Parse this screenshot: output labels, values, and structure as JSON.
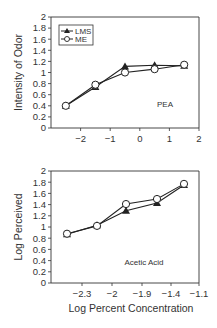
{
  "chart_data": [
    {
      "type": "line",
      "title": "",
      "annotation": "PEA",
      "xlabel": "",
      "ylabel": "Intensity of Odor",
      "xlim": [
        -3,
        2
      ],
      "ylim": [
        0,
        2
      ],
      "xticks": [
        "-2",
        "-1",
        "0",
        "1",
        "2"
      ],
      "yticks": [
        "0",
        "0.2",
        "0.4",
        "0.6",
        "0.8",
        "1",
        "1.2",
        "1.4",
        "1.6",
        "1.8",
        "2"
      ],
      "grid": false,
      "legend_position": "upper left",
      "x": [
        -2.5,
        -1.5,
        -0.5,
        0.5,
        1.5
      ],
      "series": [
        {
          "name": "LMS",
          "marker": "filled-triangle",
          "values": [
            0.4,
            0.74,
            1.11,
            1.13,
            1.12
          ]
        },
        {
          "name": "ME",
          "marker": "open-circle",
          "values": [
            0.4,
            0.78,
            1.0,
            1.06,
            1.14
          ]
        }
      ]
    },
    {
      "type": "line",
      "title": "",
      "annotation": "Acetic Acid",
      "xlabel": "Log Percent Concentration",
      "ylabel": "Log Perceived",
      "xlim": [
        -2.45,
        -1.1
      ],
      "ylim": [
        0,
        2
      ],
      "xticks": [
        "-2.3",
        "-2",
        "-1.9",
        "-1.4",
        "-1.1"
      ],
      "yticks": [
        "0",
        "0.2",
        "0.4",
        "0.6",
        "0.8",
        "1",
        "1.2",
        "1.4",
        "1.6",
        "1.8",
        "2"
      ],
      "grid": false,
      "x": [
        -2.45,
        -2.15,
        -1.95,
        -1.6,
        -1.25
      ],
      "series": [
        {
          "name": "LMS",
          "marker": "filled-triangle",
          "values": [
            0.87,
            1.03,
            1.29,
            1.43,
            1.75
          ]
        },
        {
          "name": "ME",
          "marker": "open-circle",
          "values": [
            0.88,
            1.02,
            1.41,
            1.5,
            1.77
          ]
        }
      ]
    }
  ]
}
